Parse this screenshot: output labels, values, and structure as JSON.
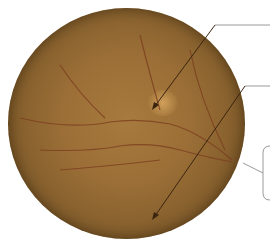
{
  "figure": {
    "annotations": [
      {
        "id": "pointer-upper",
        "label": ""
      },
      {
        "id": "pointer-lower",
        "label": ""
      },
      {
        "id": "bracket-callout",
        "label": ""
      }
    ],
    "colors": {
      "fundus": "#9a6e36",
      "vessel": "#7a3a1e",
      "arrow": "#3a2410",
      "leader": "#9a9a9a"
    }
  }
}
